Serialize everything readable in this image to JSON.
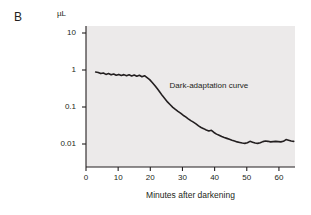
{
  "figure": {
    "panel_label": "B",
    "y_unit": "µL",
    "annotation": "Dark-adaptation curve",
    "x_axis_title": "Minutes after darkening",
    "panel_background": "#eceaea",
    "line_color": "#231f20"
  },
  "chart_data": {
    "type": "line",
    "title": "Dark-adaptation curve",
    "xlabel": "Minutes after darkening",
    "ylabel": "µL",
    "yscale": "log",
    "xlim": [
      0,
      65
    ],
    "ylim": [
      0.003,
      18
    ],
    "grid": false,
    "legend": "none",
    "x_ticks": [
      0,
      10,
      20,
      30,
      40,
      50,
      60
    ],
    "x_tick_labels": [
      "0",
      "10",
      "20",
      "30",
      "40",
      "50",
      "60"
    ],
    "y_ticks": [
      10,
      1,
      0.1,
      0.01
    ],
    "y_tick_labels": [
      "10",
      "1",
      "0.1",
      "0.01"
    ],
    "annotations": [
      {
        "text": "Dark-adaptation curve",
        "x": 26,
        "y": 0.35
      }
    ],
    "series": [
      {
        "name": "Dark-adaptation curve",
        "x": [
          3.0,
          3.8,
          4.6,
          5.4,
          6.2,
          7.0,
          7.8,
          8.6,
          9.4,
          10.2,
          11.0,
          11.8,
          12.6,
          13.4,
          14.2,
          15.0,
          15.8,
          16.6,
          17.4,
          18.2,
          19.0,
          19.8,
          20.6,
          21.4,
          22.2,
          23.0,
          23.8,
          24.6,
          25.4,
          26.2,
          27.0,
          27.8,
          28.6,
          29.4,
          30.2,
          31.0,
          31.8,
          32.6,
          33.4,
          34.2,
          35.0,
          35.8,
          36.6,
          37.4,
          38.2,
          39.0,
          39.8,
          40.6,
          41.4,
          42.2,
          43.0,
          43.8,
          44.6,
          45.4,
          46.2,
          47.0,
          47.8,
          48.6,
          49.4,
          50.2,
          51.0,
          51.8,
          52.6,
          53.4,
          54.2,
          55.0,
          55.8,
          56.6,
          57.4,
          58.2,
          59.0,
          59.8,
          60.6,
          61.4,
          62.2,
          63.0,
          63.8,
          64.6
        ],
        "y": [
          0.88,
          0.86,
          0.8,
          0.83,
          0.76,
          0.8,
          0.74,
          0.78,
          0.72,
          0.76,
          0.71,
          0.75,
          0.7,
          0.74,
          0.69,
          0.73,
          0.68,
          0.72,
          0.66,
          0.7,
          0.62,
          0.55,
          0.46,
          0.38,
          0.31,
          0.25,
          0.2,
          0.165,
          0.135,
          0.115,
          0.098,
          0.086,
          0.076,
          0.068,
          0.06,
          0.054,
          0.048,
          0.043,
          0.039,
          0.035,
          0.031,
          0.028,
          0.026,
          0.024,
          0.0225,
          0.0235,
          0.0205,
          0.0185,
          0.0172,
          0.016,
          0.015,
          0.0142,
          0.0134,
          0.0126,
          0.012,
          0.0114,
          0.011,
          0.0106,
          0.0104,
          0.0108,
          0.0118,
          0.0112,
          0.0106,
          0.0104,
          0.0108,
          0.0116,
          0.012,
          0.0118,
          0.0114,
          0.0116,
          0.0118,
          0.0116,
          0.0114,
          0.0118,
          0.0132,
          0.0126,
          0.012,
          0.0118
        ]
      }
    ]
  }
}
